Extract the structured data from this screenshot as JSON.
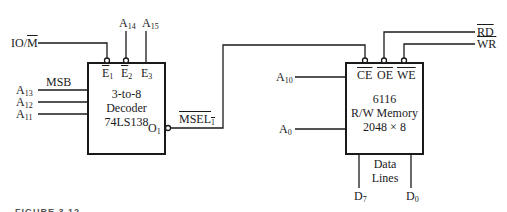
{
  "decoder": {
    "line1": "3-to-8",
    "line2": "Decoder",
    "line3": "74LS138",
    "enable_inputs": [
      {
        "name": "E",
        "sub": "1",
        "active_low": true
      },
      {
        "name": "E",
        "sub": "2",
        "active_low": true
      },
      {
        "name": "E",
        "sub": "3",
        "active_low": false
      }
    ],
    "output": {
      "name": "O",
      "sub": "1"
    },
    "select_inputs": [
      {
        "name": "A",
        "sub": "13"
      },
      {
        "name": "A",
        "sub": "12"
      },
      {
        "name": "A",
        "sub": "11"
      }
    ],
    "msb_label": "MSB"
  },
  "signals": {
    "io_m": {
      "prefix": "IO/",
      "bar": "M"
    },
    "a14": {
      "name": "A",
      "sub": "14"
    },
    "a15": {
      "name": "A",
      "sub": "15"
    },
    "msel": {
      "name": "MSEL",
      "sub": "1"
    },
    "rd": "RD",
    "wr": "WR",
    "a10": {
      "name": "A",
      "sub": "10"
    },
    "a0": {
      "name": "A",
      "sub": "0"
    }
  },
  "memory": {
    "control_pins": [
      "CE",
      "OE",
      "WE"
    ],
    "line1": "6116",
    "line2": "R/W Memory",
    "line3": "2048 × 8",
    "data_label_1": "Data",
    "data_label_2": "Lines",
    "data_pins": [
      {
        "name": "D",
        "sub": "7"
      },
      {
        "name": "D",
        "sub": "0"
      }
    ]
  },
  "caption": "FIGURE 3.12"
}
